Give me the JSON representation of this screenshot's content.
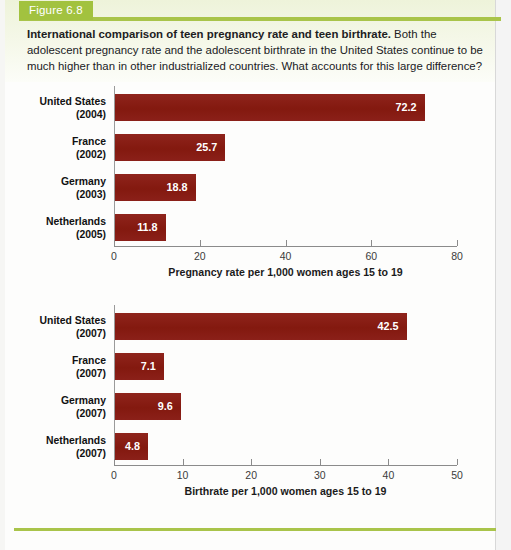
{
  "figure": {
    "tab_label": "Figure 6.8",
    "caption_bold": "International comparison of teen pregnancy rate and teen birthrate.",
    "caption_rest": " Both the adolescent pregnancy rate and the adolescent birthrate in the United States continue to be much higher than in other industrialized countries. What accounts for this large difference?"
  },
  "colors": {
    "bar": "#8b2019",
    "accent_green": "#a9c44a",
    "tab_green": "#a2c23f",
    "axis": "#8b8b8b",
    "value_text": "#ffffff"
  },
  "chart_data": [
    {
      "type": "bar",
      "orientation": "horizontal",
      "title": "",
      "xlabel": "Pregnancy rate per 1,000 women ages 15 to 19",
      "ylabel": "",
      "xlim": [
        0,
        80
      ],
      "xticks": [
        0,
        20,
        40,
        60,
        80
      ],
      "xticklabels": [
        "0",
        "20",
        "40",
        "60",
        "80"
      ],
      "grid": false,
      "legend": "none",
      "categories": [
        "United States",
        "France",
        "Germany",
        "Netherlands"
      ],
      "years": [
        "(2004)",
        "(2002)",
        "(2003)",
        "(2005)"
      ],
      "values": [
        72.2,
        25.7,
        18.8,
        11.8
      ],
      "value_labels": [
        "72.2",
        "25.7",
        "18.8",
        "11.8"
      ]
    },
    {
      "type": "bar",
      "orientation": "horizontal",
      "title": "",
      "xlabel": "Birthrate per 1,000 women ages 15 to 19",
      "ylabel": "",
      "xlim": [
        0,
        50
      ],
      "xticks": [
        0,
        10,
        20,
        30,
        40,
        50
      ],
      "xticklabels": [
        "0",
        "10",
        "20",
        "30",
        "40",
        "50"
      ],
      "grid": false,
      "legend": "none",
      "categories": [
        "United States",
        "France",
        "Germany",
        "Netherlands"
      ],
      "years": [
        "(2007)",
        "(2007)",
        "(2007)",
        "(2007)"
      ],
      "values": [
        42.5,
        7.1,
        9.6,
        4.8
      ],
      "value_labels": [
        "42.5",
        "7.1",
        "9.6",
        "4.8"
      ]
    }
  ]
}
